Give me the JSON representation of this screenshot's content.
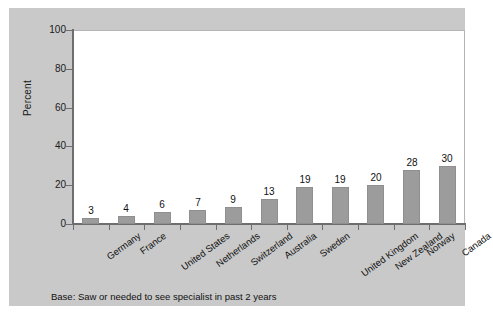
{
  "chart_data": {
    "type": "bar",
    "title": "",
    "subtitle": "",
    "xlabel": "",
    "ylabel": "Percent",
    "ylim": [
      0,
      100
    ],
    "yticks": [
      0,
      20,
      40,
      60,
      80,
      100
    ],
    "ytick_labels": [
      "0",
      "20",
      "40",
      "60",
      "80",
      "100"
    ],
    "grid": false,
    "legend": null,
    "categories": [
      "Germany",
      "France",
      "United States",
      "Netherlands",
      "Switzerland",
      "Australia",
      "Sweden",
      "United Kingdom",
      "New Zealand",
      "Norway",
      "Canada"
    ],
    "values": [
      3,
      4,
      6,
      7,
      9,
      13,
      19,
      19,
      20,
      28,
      30
    ],
    "value_labels": [
      "3",
      "4",
      "6",
      "7",
      "9",
      "13",
      "19",
      "19",
      "20",
      "28",
      "30"
    ],
    "annotations": [
      "Base: Saw or needed to see specialist in past 2 years"
    ],
    "colors": {
      "bar_fill": "#9c9c9c",
      "bar_edge": "#8f8f8f",
      "plot_background": "#ffffff",
      "panel_background": "#c9c9c9",
      "axis_line": "#6e6e6e",
      "text": "#111111"
    }
  },
  "footnote": {
    "text": "Base: Saw or needed to see specialist in past 2 years"
  }
}
